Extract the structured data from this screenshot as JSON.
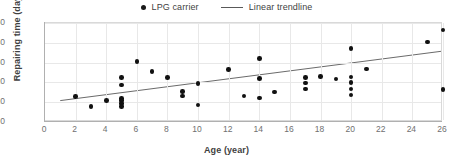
{
  "chart_data": {
    "type": "scatter",
    "title": "",
    "xlabel": "Age (year)",
    "ylabel": "Repairing time (day)",
    "xlim": [
      0,
      26
    ],
    "ylim": [
      0,
      50
    ],
    "xticks": [
      0,
      2,
      4,
      6,
      8,
      10,
      12,
      14,
      16,
      18,
      20,
      22,
      24,
      26
    ],
    "yticks": [
      0,
      10,
      20,
      30,
      40,
      50
    ],
    "grid": true,
    "legend_position": "top-center",
    "legend": [
      {
        "label": "LPG carrier",
        "marker": "dot",
        "color": "#111111"
      },
      {
        "label": "Linear trendline",
        "marker": "line",
        "color": "#595959"
      }
    ],
    "series": [
      {
        "name": "LPG carrier",
        "marker": "dot",
        "color": "#111111",
        "points": [
          [
            2,
            12.8
          ],
          [
            3,
            7.9
          ],
          [
            4,
            10.8
          ],
          [
            5,
            22.6
          ],
          [
            5,
            18.6
          ],
          [
            5,
            11.9
          ],
          [
            5,
            10.9
          ],
          [
            5,
            9.2
          ],
          [
            5,
            7.7
          ],
          [
            6,
            30.5
          ],
          [
            7,
            25.6
          ],
          [
            8,
            22.5
          ],
          [
            9,
            15.4
          ],
          [
            9,
            13.1
          ],
          [
            10,
            19.4
          ],
          [
            10,
            8.6
          ],
          [
            12,
            26.4
          ],
          [
            13,
            13.2
          ],
          [
            14,
            32.1
          ],
          [
            14,
            22.1
          ],
          [
            14,
            12.2
          ],
          [
            15,
            15.1
          ],
          [
            17,
            22.6
          ],
          [
            17,
            19.7
          ],
          [
            17,
            16.7
          ],
          [
            18,
            23.1
          ],
          [
            19,
            21.8
          ],
          [
            20,
            37.0
          ],
          [
            20,
            22.8
          ],
          [
            20,
            19.8
          ],
          [
            20,
            16.6
          ],
          [
            20,
            13.7
          ],
          [
            21,
            26.8
          ],
          [
            25,
            40.5
          ],
          [
            26,
            46.4
          ],
          [
            26,
            16.3
          ]
        ]
      }
    ],
    "trendline": {
      "name": "Linear trendline",
      "color": "#595959",
      "x_start": 1.0,
      "y_start": 10.0,
      "x_end": 26.0,
      "y_end": 35.4
    }
  }
}
